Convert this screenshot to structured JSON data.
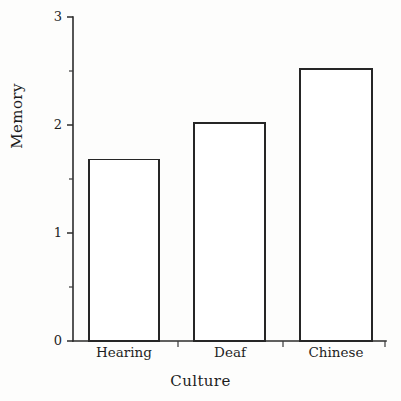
{
  "chart_data": {
    "type": "bar",
    "title": "",
    "xlabel": "Culture",
    "ylabel": "Memory",
    "categories": [
      "Hearing",
      "Deaf",
      "Chinese"
    ],
    "values": [
      1.68,
      2.02,
      2.52
    ],
    "ylim": [
      0,
      3
    ],
    "ytick_labels": [
      "0",
      "1",
      "2",
      "3"
    ],
    "ytick_values": [
      0,
      1,
      2,
      3
    ],
    "yminor_tick_values": [
      0.5,
      1.5,
      2.5
    ],
    "grid": false,
    "legend": "none",
    "bar_style": "outline",
    "bar_fill_color": "#ffffff",
    "bar_edge_color": "#262626",
    "axis_color": "#2b2b2b",
    "background_color": "#fdfdfc"
  },
  "axes": {
    "y_title": "Memory",
    "x_title": "Culture"
  },
  "ticks": {
    "y": [
      {
        "label": "3"
      },
      {
        "label": "2"
      },
      {
        "label": "1"
      },
      {
        "label": "0"
      }
    ],
    "x": [
      {
        "label": "Hearing"
      },
      {
        "label": "Deaf"
      },
      {
        "label": "Chinese"
      }
    ]
  }
}
